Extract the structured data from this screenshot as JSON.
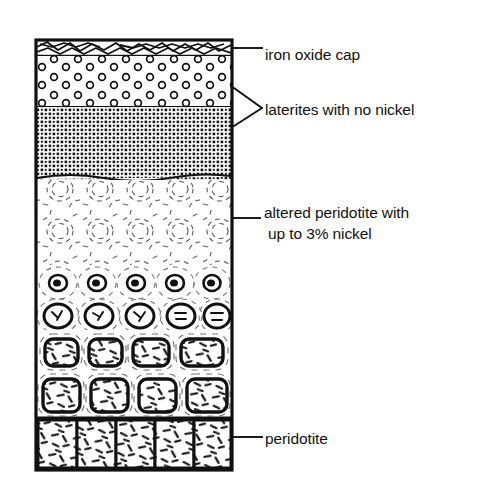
{
  "figure": {
    "type": "geological-cross-section",
    "column": {
      "left": 36,
      "right": 232,
      "top": 40,
      "bottom": 470
    },
    "colors": {
      "ink": "#111111",
      "background": "#ffffff",
      "fill": "#ffffff"
    }
  },
  "labels": {
    "iron_oxide_cap": "iron oxide cap",
    "laterites": "laterites with no nickel",
    "altered_line1": "altered peridotite with",
    "altered_line2": "up to 3% nickel",
    "peridotite": "peridotite"
  },
  "layers": [
    {
      "id": "iron-oxide-cap",
      "name": "iron oxide cap",
      "top": 40,
      "bottom": 56,
      "pattern": "jagged-rubble",
      "label": "iron oxide cap"
    },
    {
      "id": "laterite-circles",
      "name": "laterite with open circles",
      "top": 56,
      "bottom": 107,
      "pattern": "open-circles",
      "label": "laterites with no nickel"
    },
    {
      "id": "laterite-stipple",
      "name": "dense stippled laterite",
      "top": 107,
      "bottom": 180,
      "pattern": "dense-stipple",
      "label": "laterites with no nickel"
    },
    {
      "id": "saprolite-faint",
      "name": "faint spheroidal saprolite",
      "top": 180,
      "bottom": 265,
      "pattern": "faint-spheroids",
      "label": "altered peridotite with up to 3% nickel"
    },
    {
      "id": "corestones-small",
      "name": "small corestones with rinds",
      "top": 265,
      "bottom": 330,
      "pattern": "corestones-small",
      "label": "altered peridotite with up to 3% nickel"
    },
    {
      "id": "corestones-large",
      "name": "large angular corestones",
      "top": 330,
      "bottom": 418,
      "pattern": "corestones-large",
      "label": "altered peridotite with up to 3% nickel"
    },
    {
      "id": "peridotite-bedrock",
      "name": "fresh peridotite bedrock",
      "top": 418,
      "bottom": 470,
      "pattern": "blocky-dash-hatch",
      "blocks": 5,
      "label": "peridotite"
    }
  ],
  "leaders": [
    {
      "id": "leader-iron-oxide",
      "kind": "line",
      "from_y": 48,
      "to_x": 262
    },
    {
      "id": "leader-laterites",
      "kind": "bracket",
      "top_y": 88,
      "bottom_y": 126,
      "apex_x": 262,
      "apex_y": 108
    },
    {
      "id": "leader-altered",
      "kind": "line",
      "from_y": 218,
      "to_x": 260
    },
    {
      "id": "leader-peridotite",
      "kind": "line",
      "from_y": 437,
      "to_x": 262
    }
  ]
}
